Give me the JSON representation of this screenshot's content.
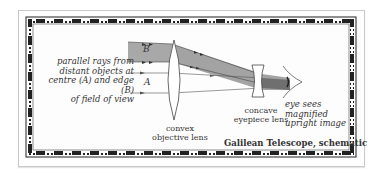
{
  "diagram": {
    "title": "Galilean Telescope, schematic",
    "labels": {
      "rays_description": [
        "parallel rays from",
        "distant objects at",
        "centre (A) and edge (B)",
        "of field of view"
      ],
      "ray_b": "B",
      "ray_a": "A",
      "objective_lens": [
        "convex",
        "objective lens"
      ],
      "eyepiece_lens": [
        "concave",
        "eyepiece lens"
      ],
      "eye": [
        "eye sees magnified",
        "upright image"
      ]
    },
    "colors": {
      "beam_fill": "#a8a8a8",
      "line": "#444444",
      "border": "#222222",
      "text": "#333333"
    },
    "components": [
      "objective-lens",
      "eyepiece-lens",
      "eye",
      "ray-beam-B",
      "rays-A"
    ]
  }
}
